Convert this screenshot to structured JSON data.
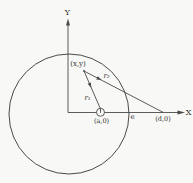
{
  "figure": {
    "kind": "geometry-diagram",
    "background_color": "#f8f8f6",
    "line_color": "#4a4a4a",
    "text_color": "#2f2f2f",
    "labels": {
      "y_axis": "Y",
      "x_axis": "X",
      "point_xy": "(x,y)",
      "r1": "r₁",
      "r2": "r₂",
      "e": "e",
      "point_a": "(a,0)",
      "point_d": "(d,0)"
    }
  }
}
